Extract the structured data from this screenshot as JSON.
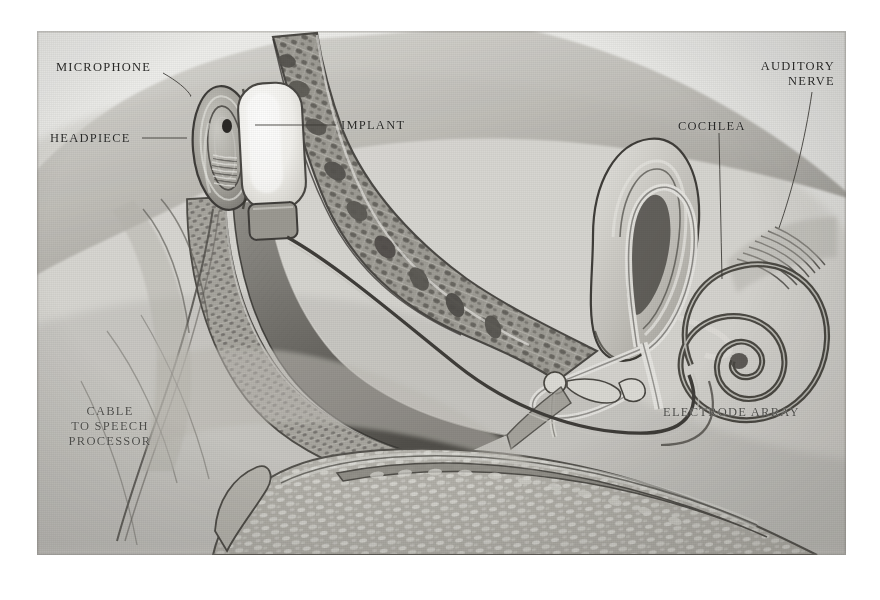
{
  "figure": {
    "kind": "anatomical-illustration",
    "medium": "graphite pencil rendering on grey paper",
    "plate": {
      "left": 37,
      "top": 31,
      "width": 809,
      "height": 524,
      "background_color": "#e9e9e7",
      "ink_color": "#282826",
      "page_color": "#ffffff"
    }
  },
  "labels": [
    {
      "id": "microphone",
      "text": "MICROPHONE",
      "align": "left",
      "x": 56,
      "y": 60,
      "leader": {
        "from": [
          163,
          73
        ],
        "to": [
          191,
          96
        ]
      },
      "points_to": "microphone port on the external headpiece"
    },
    {
      "id": "headpiece",
      "text": "HEADPIECE",
      "align": "left",
      "x": 50,
      "y": 131,
      "leader": {
        "from": [
          142,
          138
        ],
        "to": [
          186,
          138
        ]
      },
      "points_to": "external transmitter coil disc worn on the scalp"
    },
    {
      "id": "implant",
      "text": "IMPLANT",
      "align": "left",
      "x": 341,
      "y": 118,
      "leader": {
        "from": [
          336,
          125
        ],
        "to": [
          255,
          125
        ]
      },
      "points_to": "receiver-stimulator package seated in the temporal bone"
    },
    {
      "id": "cochlea",
      "text": "COCHLEA",
      "align": "left",
      "x": 678,
      "y": 119,
      "leader": {
        "from": [
          719,
          133
        ],
        "to": [
          722,
          258
        ]
      },
      "points_to": "spiral cochlea of the inner ear"
    },
    {
      "id": "auditory-nerve",
      "text": "AUDITORY\nNERVE",
      "align": "right",
      "x": 716,
      "y": 59,
      "leader": {
        "from": [
          812,
          92
        ],
        "to": [
          779,
          228
        ]
      },
      "points_to": "cochlear branch of the vestibulocochlear nerve"
    },
    {
      "id": "electrode-array",
      "text": "ELECTRODE ARRAY",
      "align": "left",
      "x": 663,
      "y": 405,
      "leader": null,
      "points_to": "electrode lead coiled into the scala tympani"
    },
    {
      "id": "cable-to-speech-processor",
      "text": "CABLE\nTO SPEECH\nPROCESSOR",
      "align": "center",
      "x": 45,
      "y": 404,
      "leader": null,
      "points_to": "lead running down from the headpiece to the body-worn processor"
    }
  ],
  "anatomy": [
    {
      "id": "scalp-skin",
      "name": "scalp and skin surface"
    },
    {
      "id": "skull-diploe",
      "name": "skull with trabecular (spongy) bone"
    },
    {
      "id": "headpiece-coil",
      "name": "external headpiece coil"
    },
    {
      "id": "microphone-port",
      "name": "microphone"
    },
    {
      "id": "implant-body",
      "name": "internal implant receiver"
    },
    {
      "id": "pinna",
      "name": "auricle / pinna"
    },
    {
      "id": "ear-canal",
      "name": "external auditory canal"
    },
    {
      "id": "tympanic-membrane",
      "name": "tympanic membrane"
    },
    {
      "id": "ossicles",
      "name": "malleus, incus and stapes"
    },
    {
      "id": "semicircular-canals",
      "name": "semicircular canals"
    },
    {
      "id": "cochlea-spiral",
      "name": "cochlea"
    },
    {
      "id": "auditory-nerve-fibres",
      "name": "auditory nerve fibres"
    },
    {
      "id": "electrode-lead",
      "name": "electrode array lead"
    },
    {
      "id": "mandible",
      "name": "mandible / jaw bone"
    },
    {
      "id": "processor-cable",
      "name": "cable to speech processor"
    }
  ]
}
